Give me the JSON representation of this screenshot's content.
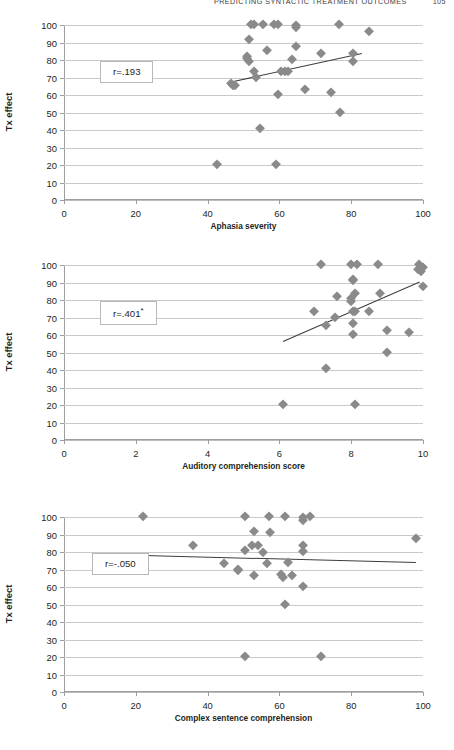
{
  "running_head": {
    "title": "Predicting syntactic treatment outcomes",
    "page": "105"
  },
  "chart_data": [
    {
      "id": "chart-1",
      "type": "scatter",
      "title": "",
      "xlabel": "Aphasia severity",
      "ylabel": "Tx effect",
      "xlim": [
        0,
        100
      ],
      "ylim": [
        0,
        100
      ],
      "xticks": [
        0,
        20,
        40,
        60,
        80,
        100
      ],
      "yticks": [
        0,
        10,
        20,
        30,
        40,
        50,
        60,
        70,
        80,
        90,
        100
      ],
      "grid": true,
      "legend": "none",
      "annotation": "r=.193",
      "annotation_sup": "",
      "marker": "diamond",
      "marker_color": "#8a8a8a",
      "trendline": {
        "x0": 46.0,
        "y0": 67.5,
        "x1": 83.0,
        "y1": 84.0
      },
      "points": [
        {
          "x": 52.0,
          "y": 100.5
        },
        {
          "x": 53.0,
          "y": 100.5
        },
        {
          "x": 55.5,
          "y": 100.5
        },
        {
          "x": 58.5,
          "y": 100.5
        },
        {
          "x": 59.5,
          "y": 100.5
        },
        {
          "x": 64.5,
          "y": 100.0
        },
        {
          "x": 64.5,
          "y": 99.0
        },
        {
          "x": 76.5,
          "y": 100.5
        },
        {
          "x": 85.0,
          "y": 96.8
        },
        {
          "x": 51.5,
          "y": 92.2
        },
        {
          "x": 64.5,
          "y": 88.2
        },
        {
          "x": 56.5,
          "y": 85.5
        },
        {
          "x": 51.0,
          "y": 82.2
        },
        {
          "x": 51.0,
          "y": 81.0
        },
        {
          "x": 63.5,
          "y": 80.5
        },
        {
          "x": 51.5,
          "y": 79.5
        },
        {
          "x": 71.5,
          "y": 84.0
        },
        {
          "x": 80.5,
          "y": 84.2
        },
        {
          "x": 80.5,
          "y": 79.2
        },
        {
          "x": 53.0,
          "y": 73.8
        },
        {
          "x": 60.5,
          "y": 74.0
        },
        {
          "x": 61.5,
          "y": 74.0
        },
        {
          "x": 62.5,
          "y": 73.8
        },
        {
          "x": 53.5,
          "y": 70.5
        },
        {
          "x": 46.5,
          "y": 67.0
        },
        {
          "x": 47.0,
          "y": 66.0
        },
        {
          "x": 47.5,
          "y": 65.5
        },
        {
          "x": 59.5,
          "y": 60.4
        },
        {
          "x": 67.0,
          "y": 63.2
        },
        {
          "x": 74.5,
          "y": 62.0
        },
        {
          "x": 77.0,
          "y": 50.3
        },
        {
          "x": 54.5,
          "y": 41.0
        },
        {
          "x": 42.5,
          "y": 20.5
        },
        {
          "x": 59.0,
          "y": 20.8
        }
      ]
    },
    {
      "id": "chart-2",
      "type": "scatter",
      "title": "",
      "xlabel": "Auditory comprehension score",
      "ylabel": "Tx effect",
      "xlim": [
        0,
        10
      ],
      "ylim": [
        0,
        100
      ],
      "xticks": [
        0,
        2,
        4,
        6,
        8,
        10
      ],
      "yticks": [
        0,
        10,
        20,
        30,
        40,
        50,
        60,
        70,
        80,
        90,
        100
      ],
      "grid": true,
      "legend": "none",
      "annotation": "r=.401",
      "annotation_sup": "*",
      "marker": "diamond",
      "marker_color": "#8a8a8a",
      "trendline": {
        "x0": 6.1,
        "y0": 56.5,
        "x1": 9.9,
        "y1": 90.5
      },
      "points": [
        {
          "x": 7.15,
          "y": 100.5
        },
        {
          "x": 8.0,
          "y": 100.5
        },
        {
          "x": 8.15,
          "y": 100.5
        },
        {
          "x": 8.75,
          "y": 100.5
        },
        {
          "x": 9.9,
          "y": 100.3
        },
        {
          "x": 10.0,
          "y": 99.0
        },
        {
          "x": 9.85,
          "y": 98.0
        },
        {
          "x": 9.95,
          "y": 96.8
        },
        {
          "x": 8.05,
          "y": 92.2
        },
        {
          "x": 8.05,
          "y": 91.2
        },
        {
          "x": 10.0,
          "y": 88.2
        },
        {
          "x": 8.1,
          "y": 84.2
        },
        {
          "x": 8.8,
          "y": 84.0
        },
        {
          "x": 7.6,
          "y": 82.2
        },
        {
          "x": 8.0,
          "y": 81.0
        },
        {
          "x": 8.0,
          "y": 79.5
        },
        {
          "x": 6.95,
          "y": 73.8
        },
        {
          "x": 8.05,
          "y": 74.0
        },
        {
          "x": 8.1,
          "y": 73.8
        },
        {
          "x": 8.5,
          "y": 73.8
        },
        {
          "x": 7.55,
          "y": 70.5
        },
        {
          "x": 8.05,
          "y": 67.0
        },
        {
          "x": 7.3,
          "y": 65.5
        },
        {
          "x": 8.05,
          "y": 60.4
        },
        {
          "x": 9.0,
          "y": 63.0
        },
        {
          "x": 9.6,
          "y": 62.0
        },
        {
          "x": 9.0,
          "y": 50.5
        },
        {
          "x": 7.3,
          "y": 41.2
        },
        {
          "x": 6.1,
          "y": 20.5
        },
        {
          "x": 8.1,
          "y": 20.5
        }
      ]
    },
    {
      "id": "chart-3",
      "type": "scatter",
      "title": "",
      "xlabel": "Complex sentence comprehension",
      "ylabel": "Tx effect",
      "xlim": [
        0,
        100
      ],
      "ylim": [
        0,
        100
      ],
      "xticks": [
        0,
        20,
        40,
        60,
        80,
        100
      ],
      "yticks": [
        0,
        10,
        20,
        30,
        40,
        50,
        60,
        70,
        80,
        90,
        100
      ],
      "grid": true,
      "legend": "none",
      "annotation": "r=-.050",
      "annotation_sup": "",
      "marker": "diamond",
      "marker_color": "#8a8a8a",
      "trendline": {
        "x0": 22.0,
        "y0": 78.5,
        "x1": 98.0,
        "y1": 74.5
      },
      "points": [
        {
          "x": 22.0,
          "y": 100.5
        },
        {
          "x": 50.5,
          "y": 100.5
        },
        {
          "x": 57.0,
          "y": 100.5
        },
        {
          "x": 61.5,
          "y": 100.5
        },
        {
          "x": 66.5,
          "y": 100.0
        },
        {
          "x": 68.5,
          "y": 100.5
        },
        {
          "x": 66.5,
          "y": 98.5
        },
        {
          "x": 53.0,
          "y": 92.2
        },
        {
          "x": 57.5,
          "y": 91.2
        },
        {
          "x": 98.0,
          "y": 88.2
        },
        {
          "x": 36.0,
          "y": 84.0
        },
        {
          "x": 52.5,
          "y": 84.2
        },
        {
          "x": 54.0,
          "y": 84.0
        },
        {
          "x": 66.5,
          "y": 84.2
        },
        {
          "x": 50.5,
          "y": 81.0
        },
        {
          "x": 55.5,
          "y": 80.0
        },
        {
          "x": 66.5,
          "y": 80.5
        },
        {
          "x": 44.5,
          "y": 73.8
        },
        {
          "x": 56.5,
          "y": 74.0
        },
        {
          "x": 62.5,
          "y": 74.5
        },
        {
          "x": 48.5,
          "y": 70.5
        },
        {
          "x": 48.5,
          "y": 69.5
        },
        {
          "x": 53.0,
          "y": 67.0
        },
        {
          "x": 60.5,
          "y": 67.2
        },
        {
          "x": 61.0,
          "y": 66.0
        },
        {
          "x": 63.5,
          "y": 66.8
        },
        {
          "x": 66.5,
          "y": 60.4
        },
        {
          "x": 61.5,
          "y": 50.5
        },
        {
          "x": 50.5,
          "y": 20.5
        },
        {
          "x": 71.5,
          "y": 20.5
        }
      ]
    }
  ]
}
